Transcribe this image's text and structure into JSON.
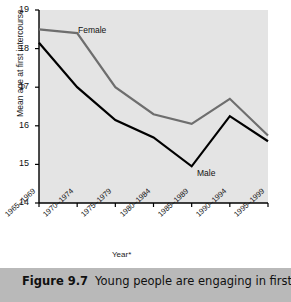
{
  "figure": {
    "caption_label": "Figure 9.7",
    "caption_text": "Young people are engaging in first"
  },
  "colors": {
    "plot_background": "#e4e4e4",
    "page_background": "#ffffff",
    "caption_background": "#b9b9b9",
    "male_line": "#000000",
    "female_line": "#6e6e6e",
    "axis": "#000000"
  },
  "chart_data": {
    "type": "line",
    "title": "",
    "xlabel": "Year*",
    "ylabel": "Mean age at first intercourse",
    "categories": [
      "1965–1969",
      "1970–1974",
      "1975–1979",
      "1980–1984",
      "1985–1989",
      "1990–1994",
      "1995–1999"
    ],
    "series": [
      {
        "name": "Female",
        "color": "#6e6e6e",
        "values": [
          18.5,
          18.4,
          17.0,
          16.3,
          16.05,
          16.7,
          15.75
        ]
      },
      {
        "name": "Male",
        "color": "#000000",
        "values": [
          18.15,
          17.0,
          16.15,
          15.7,
          14.95,
          16.25,
          15.6
        ]
      }
    ],
    "ylim": [
      14,
      19
    ],
    "yticks": [
      14,
      15,
      16,
      17,
      18,
      19
    ],
    "ytick_labels": [
      "14",
      "15",
      "16",
      "17",
      "18",
      "19"
    ],
    "grid": false,
    "legend": "inline-labels"
  }
}
